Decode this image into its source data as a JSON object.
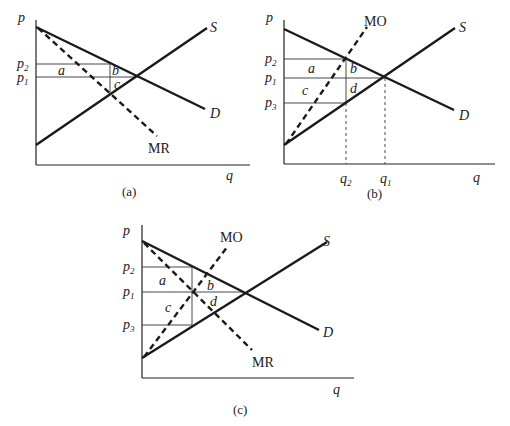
{
  "panels": [
    {
      "id": "a",
      "caption": "(a)",
      "axis_labels": {
        "y": "p",
        "x": "q"
      },
      "price_labels": [
        {
          "base": "p",
          "sub": "2"
        },
        {
          "base": "p",
          "sub": "1"
        }
      ],
      "curves": {
        "supply": "S",
        "demand": "D",
        "marginal_revenue": "MR"
      },
      "areas": [
        "a",
        "b",
        "c"
      ]
    },
    {
      "id": "b",
      "caption": "(b)",
      "axis_labels": {
        "y": "p",
        "x": "q"
      },
      "price_labels": [
        {
          "base": "p",
          "sub": "2"
        },
        {
          "base": "p",
          "sub": "1"
        },
        {
          "base": "p",
          "sub": "3"
        }
      ],
      "quantity_labels": [
        {
          "base": "q",
          "sub": "2"
        },
        {
          "base": "q",
          "sub": "1"
        }
      ],
      "curves": {
        "supply": "S",
        "demand": "D",
        "marginal_outlay": "MO"
      },
      "areas": [
        "a",
        "b",
        "c",
        "d"
      ]
    },
    {
      "id": "c",
      "caption": "(c)",
      "axis_labels": {
        "y": "p",
        "x": "q"
      },
      "price_labels": [
        {
          "base": "p",
          "sub": "2"
        },
        {
          "base": "p",
          "sub": "1"
        },
        {
          "base": "p",
          "sub": "3"
        }
      ],
      "curves": {
        "supply": "S",
        "demand": "D",
        "marginal_outlay": "MO",
        "marginal_revenue": "MR"
      },
      "areas": [
        "a",
        "b",
        "c",
        "d"
      ]
    }
  ]
}
